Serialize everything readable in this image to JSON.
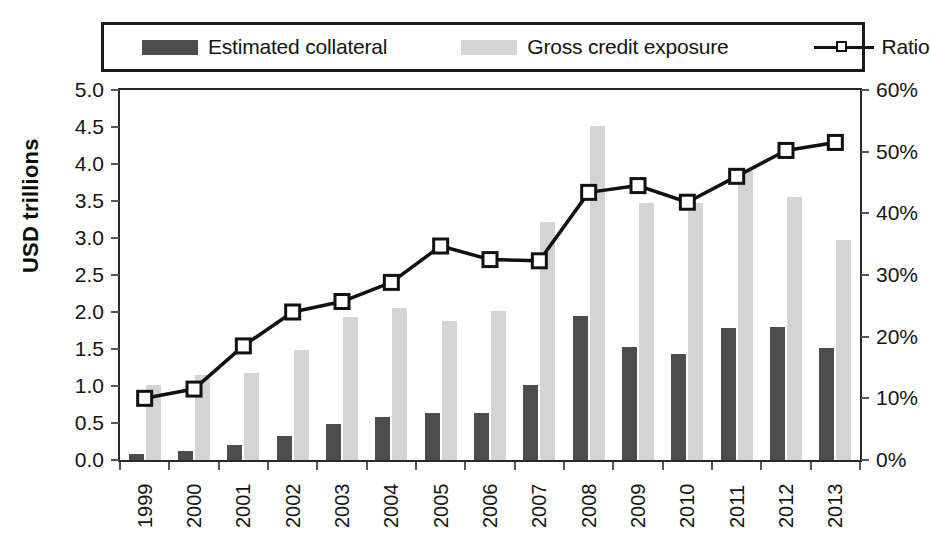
{
  "legend": {
    "items": [
      {
        "id": "collateral",
        "label": "Estimated collateral",
        "marker": "dark-square-swatch",
        "color": "#4d4d4d"
      },
      {
        "id": "exposure",
        "label": "Gross credit exposure",
        "marker": "light-square-swatch",
        "color": "#d4d4d4"
      },
      {
        "id": "ratio",
        "label": "Ratio",
        "marker": "line-with-open-square-marker",
        "color": "#111111"
      }
    ]
  },
  "axes": {
    "left": {
      "title": "USD trillions",
      "ticks": [
        "0.0",
        "0.5",
        "1.0",
        "1.5",
        "2.0",
        "2.5",
        "3.0",
        "3.5",
        "4.0",
        "4.5",
        "5.0"
      ]
    },
    "right": {
      "title": "",
      "ticks": [
        "0%",
        "10%",
        "20%",
        "30%",
        "40%",
        "50%",
        "60%"
      ]
    },
    "bottom": {
      "ticks": [
        "1999",
        "2000",
        "2001",
        "2002",
        "2003",
        "2004",
        "2005",
        "2006",
        "2007",
        "2008",
        "2009",
        "2010",
        "2011",
        "2012",
        "2013"
      ]
    }
  },
  "chart_data": {
    "type": "bar",
    "title": "",
    "subtitle": "",
    "xlabel": "",
    "ylabel": "USD trillions",
    "y2label": "",
    "categories": [
      "1999",
      "2000",
      "2001",
      "2002",
      "2003",
      "2004",
      "2005",
      "2006",
      "2007",
      "2008",
      "2009",
      "2010",
      "2011",
      "2012",
      "2013"
    ],
    "ylim": [
      0,
      5
    ],
    "y2lim": [
      0,
      60
    ],
    "yticks": [
      0,
      0.5,
      1,
      1.5,
      2,
      2.5,
      3,
      3.5,
      4,
      4.5,
      5
    ],
    "y2ticks": [
      0,
      10,
      20,
      30,
      40,
      50,
      60
    ],
    "grid": false,
    "legend_position": "top",
    "series": [
      {
        "name": "Estimated collateral",
        "type": "bar",
        "axis": "left",
        "unit": "USD trillions",
        "color": "#4d4d4d",
        "values": [
          0.08,
          0.12,
          0.2,
          0.33,
          0.48,
          0.58,
          0.64,
          0.64,
          1.02,
          1.94,
          1.53,
          1.43,
          1.78,
          1.8,
          1.52
        ]
      },
      {
        "name": "Gross credit exposure",
        "type": "bar",
        "axis": "left",
        "unit": "USD trillions",
        "color": "#d4d4d4",
        "values": [
          1.01,
          1.15,
          1.17,
          1.48,
          1.93,
          2.05,
          1.88,
          2.01,
          3.22,
          4.51,
          3.47,
          3.47,
          3.9,
          3.55,
          2.97
        ]
      },
      {
        "name": "Ratio",
        "type": "line",
        "axis": "right",
        "unit": "%",
        "color": "#111111",
        "marker": "open-square",
        "values": [
          10.0,
          11.5,
          18.5,
          24.0,
          25.7,
          28.8,
          34.7,
          32.5,
          32.3,
          43.4,
          44.5,
          41.8,
          46.0,
          50.2,
          51.5
        ]
      }
    ]
  }
}
